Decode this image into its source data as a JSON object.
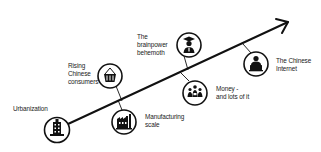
{
  "diagram": {
    "title_partial": "",
    "colors": {
      "line": "#111111",
      "text": "#222222",
      "background": "#ffffff"
    },
    "arrow": {
      "from": [
        68,
        124
      ],
      "to": [
        288,
        22
      ]
    },
    "milestones": [
      {
        "id": "urbanization",
        "label": "Urbanization",
        "icon": "building-icon",
        "position": "below-line"
      },
      {
        "id": "consumers",
        "label": "Rising\nChinese\nconsumers",
        "icon": "shopping-basket-icon",
        "position": "above-line"
      },
      {
        "id": "manufacturing",
        "label": "Manufacturing\nscale",
        "icon": "factory-icon",
        "position": "below-line"
      },
      {
        "id": "brainpower",
        "label": "The\nbrainpower\nbehemoth",
        "icon": "graduate-icon",
        "position": "above-line"
      },
      {
        "id": "money",
        "label": "Money -\nand lots of it",
        "icon": "people-money-icon",
        "position": "below-line"
      },
      {
        "id": "internet",
        "label": "The Chinese\nInternet",
        "icon": "laptop-user-icon",
        "position": "below-line"
      }
    ]
  }
}
